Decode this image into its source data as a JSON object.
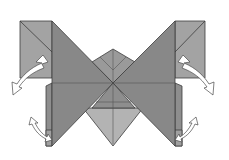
{
  "diagram": {
    "title": "",
    "colors": {
      "background": "#ffffff",
      "paper_dark": "#8a8a8a",
      "paper_mid": "#9c9c9c",
      "paper_light": "#b3b3b3",
      "edge": "#3c3c3c",
      "arrow_fill": "#ffffff"
    },
    "elements": [
      {
        "name": "left-square-flap",
        "shape": "square-with-diagonal"
      },
      {
        "name": "right-square-flap",
        "shape": "square-with-diagonal"
      },
      {
        "name": "left-large-triangle",
        "shape": "triangle"
      },
      {
        "name": "right-large-triangle",
        "shape": "triangle"
      },
      {
        "name": "center-top-point",
        "shape": "kite"
      },
      {
        "name": "center-bottom-diamond",
        "shape": "triangle"
      },
      {
        "name": "left-fold-arrow-upper",
        "shape": "curved-arrow"
      },
      {
        "name": "right-fold-arrow-upper",
        "shape": "curved-arrow"
      },
      {
        "name": "left-fold-arrow-lower",
        "shape": "double-curved-arrow"
      },
      {
        "name": "right-fold-arrow-lower",
        "shape": "double-curved-arrow"
      }
    ]
  }
}
